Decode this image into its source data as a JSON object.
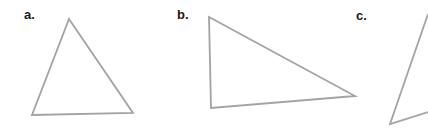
{
  "figure": {
    "width": 428,
    "height": 131,
    "stroke_color": "#a3a3a3",
    "stroke_width": 1.8,
    "label_color": "#1a1a1a"
  },
  "triangles": [
    {
      "label": "a.",
      "label_pos": [
        24,
        8
      ],
      "points": [
        [
          69,
          19
        ],
        [
          133,
          113
        ],
        [
          32,
          115
        ]
      ]
    },
    {
      "label": "b.",
      "label_pos": [
        177,
        8
      ],
      "points": [
        [
          209,
          17
        ],
        [
          355,
          96
        ],
        [
          211,
          108
        ]
      ]
    },
    {
      "label": "c.",
      "label_pos": [
        356,
        9
      ],
      "points": [
        [
          428,
          14
        ],
        [
          390,
          124
        ],
        [
          428,
          112
        ]
      ],
      "clipped": true
    }
  ]
}
